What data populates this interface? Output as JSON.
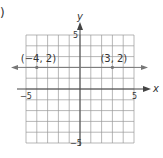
{
  "figure": {
    "part_label": ")",
    "axes": {
      "x_label": "x",
      "y_label": "y",
      "x_range": [
        -5,
        5
      ],
      "y_range": [
        -5,
        5
      ],
      "x_tick_labels": [
        {
          "value": -5,
          "label": "−5"
        },
        {
          "value": 5,
          "label": "5"
        }
      ],
      "y_tick_labels": [
        {
          "value": 5,
          "label": "5"
        },
        {
          "value": -5,
          "label": "−5"
        }
      ],
      "grid": true,
      "grid_step": 1
    },
    "line": {
      "description": "horizontal line y = 2 with arrows at both ends",
      "y": 2
    },
    "points": [
      {
        "x": -4,
        "y": 2,
        "label": "(−4, 2)"
      },
      {
        "x": 3,
        "y": 2,
        "label": "(3, 2)"
      }
    ],
    "colors": {
      "grid": "#9a9a9a",
      "axis": "#444444",
      "line": "#777777",
      "text": "#333333"
    }
  }
}
